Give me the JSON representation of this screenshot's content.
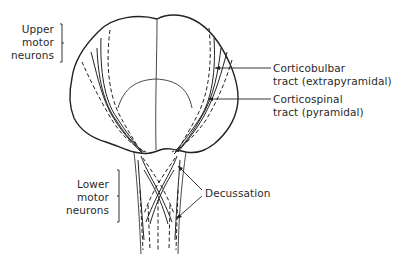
{
  "diagram": {
    "labels": {
      "upper_motor": [
        "Upper",
        "motor",
        "neurons"
      ],
      "lower_motor": [
        "Lower",
        "motor",
        "neurons"
      ],
      "corticobulbar": [
        "Corticobulbar",
        "tract (extrapyramidal)"
      ],
      "corticospinal": [
        "Corticospinal",
        "tract (pyramidal)"
      ],
      "decussation": "Decussation"
    },
    "colors": {
      "line": "#222222",
      "text": "#2a2a2a",
      "background": "#ffffff"
    }
  }
}
